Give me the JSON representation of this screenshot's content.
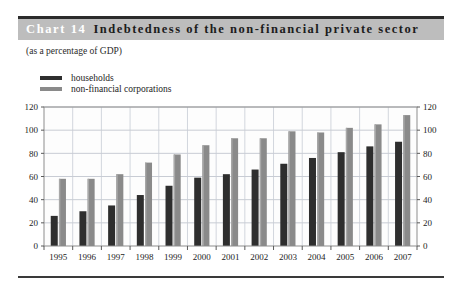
{
  "header": {
    "chart_number": "Chart 14",
    "title": "Indebtedness of the non-financial private sector",
    "band_color": "#bdbdbd",
    "number_color": "#ffffff"
  },
  "subtitle": "(as a percentage of GDP)",
  "legend": {
    "items": [
      {
        "label": "households",
        "color": "#2e2e2e"
      },
      {
        "label": "non-financial corporations",
        "color": "#8a8a8a"
      }
    ]
  },
  "axis": {
    "left_ticks": [
      "0",
      "20",
      "40",
      "60",
      "80",
      "100",
      "120"
    ],
    "right_ticks": [
      "0",
      "20",
      "40",
      "60",
      "80",
      "100",
      "120"
    ]
  },
  "chart_data": {
    "type": "bar",
    "title": "Indebtedness of the non-financial private sector",
    "subtitle": "(as a percentage of GDP)",
    "xlabel": "",
    "ylabel": "",
    "ylim": [
      0,
      120
    ],
    "yticks": [
      0,
      20,
      40,
      60,
      80,
      100,
      120
    ],
    "grid": true,
    "legend_position": "top-left",
    "categories": [
      "1995",
      "1996",
      "1997",
      "1998",
      "1999",
      "2000",
      "2001",
      "2002",
      "2003",
      "2004",
      "2005",
      "2006",
      "2007"
    ],
    "series": [
      {
        "name": "households",
        "color": "#2e2e2e",
        "values": [
          26,
          30,
          35,
          44,
          52,
          59,
          62,
          66,
          71,
          76,
          81,
          86,
          90
        ]
      },
      {
        "name": "non-financial corporations",
        "color": "#8a8a8a",
        "values": [
          58,
          58,
          62,
          72,
          79,
          87,
          93,
          93,
          99,
          98,
          102,
          105,
          113
        ]
      }
    ]
  },
  "footer": {
    "rule_color": "#3a3a3a"
  }
}
